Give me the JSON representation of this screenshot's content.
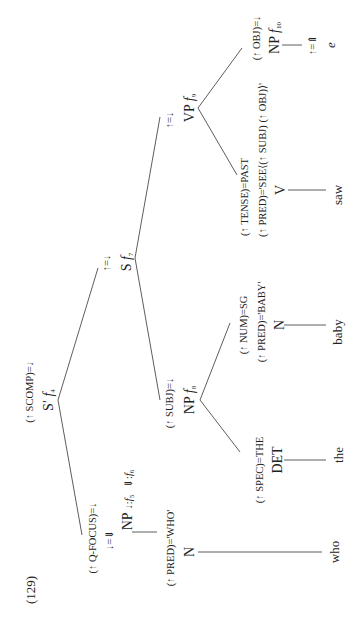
{
  "example_number": "(129)",
  "tree": {
    "root": {
      "category": "S′",
      "fvar": "f",
      "fsub": "4",
      "annotation": "(↑ SCOMP)=↓"
    },
    "np_who": {
      "annotation1": "(↑ Q-FOCUS)=↓",
      "annotation2": "↓=⇓",
      "category": "NP",
      "fvars": "↓:f5  ⇓:f6",
      "fv1": "↓:",
      "f5": "5",
      "fv2": "⇓:",
      "f6": "6"
    },
    "n_who": {
      "annotation": "(↑ PRED)='WHO'",
      "category": "N",
      "word": "who"
    },
    "s": {
      "annotation": "↑=↓",
      "category": "S",
      "fsub": "7"
    },
    "np_subj": {
      "annotation": "(↑ SUBJ)=↓",
      "category": "NP",
      "fsub": "8"
    },
    "det": {
      "annotation": "(↑ SPEC)=THE",
      "category": "DET",
      "word": "the"
    },
    "n_baby": {
      "annotation1": "(↑ NUM)=SG",
      "annotation2": "(↑ PRED)='BABY'",
      "category": "N",
      "word": "baby"
    },
    "vp": {
      "annotation": "↑=↓",
      "category": "VP",
      "fsub": "9"
    },
    "v": {
      "annotation1": "(↑ TENSE)=PAST",
      "annotation2": "(↑ PRED)='SEE⟨(↑ SUBJ) (↑ OBJ)⟩'",
      "category": "V",
      "word": "saw"
    },
    "np_obj": {
      "annotation": "(↑ OBJ)=↓",
      "category": "NP",
      "fsub": "10"
    },
    "gap": {
      "annotation": "↑=⇑",
      "word": "e"
    }
  }
}
